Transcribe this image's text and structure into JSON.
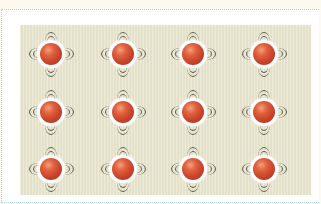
{
  "scene": {
    "description": "Grid of vibrating red balls on a beige textured panel",
    "rows": 3,
    "columns": 4,
    "colors": {
      "page_background": "#fdfbf0",
      "frame_background": "#ffffff",
      "frame_border": "#a9d6d4",
      "panel_background": "#e9e6cf",
      "ball": "#c9432a",
      "ball_highlight": "#f3a07a",
      "halo": "#ffffff",
      "motion_arcs": "#55574c"
    },
    "icons": {
      "ball": "vibrating-ball-icon"
    }
  }
}
